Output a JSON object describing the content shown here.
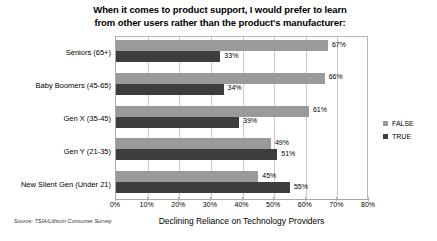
{
  "chart_data": {
    "type": "bar",
    "orientation": "horizontal",
    "title": "When it comes to product support, I would prefer to learn from other users rather than the product's manufacturer:",
    "title_line1": "When it comes to product support, I would prefer to learn",
    "title_line2": "from other users rather than the product's manufacturer:",
    "xlabel": "Declining Reliance on Technology Providers",
    "ylabel": "",
    "categories": [
      "Seniors (65+)",
      "Baby Boomers (45-65)",
      "Gen X (35-45)",
      "Gen Y (21-35)",
      "New Silent Gen (Under 21)"
    ],
    "series": [
      {
        "name": "FALSE",
        "color": "#9a9a9a",
        "values": [
          67,
          66,
          61,
          49,
          45
        ]
      },
      {
        "name": "TRUE",
        "color": "#3d3d3d",
        "values": [
          33,
          34,
          39,
          51,
          55
        ]
      }
    ],
    "data_labels": {
      "FALSE": [
        "67%",
        "66%",
        "61%",
        "49%",
        "45%"
      ],
      "TRUE": [
        "33%",
        "34%",
        "39%",
        "51%",
        "55%"
      ]
    },
    "xlim": [
      0,
      80
    ],
    "xticks": [
      0,
      10,
      20,
      30,
      40,
      50,
      60,
      70,
      80
    ],
    "xtick_labels": [
      "0%",
      "10%",
      "20%",
      "30%",
      "40%",
      "50%",
      "60%",
      "70%",
      "80%"
    ],
    "grid": true,
    "grid_axis": "x",
    "legend_position": "right",
    "legend": [
      "FALSE",
      "TRUE"
    ],
    "source": "Source: TSIA/Lithium Consumer Survey"
  },
  "colors": {
    "false_bar": "#9a9a9a",
    "true_bar": "#3d3d3d",
    "gridline": "#c9c9c9",
    "axis": "#a8a8a8",
    "text": "#000000",
    "background": "#ffffff"
  }
}
